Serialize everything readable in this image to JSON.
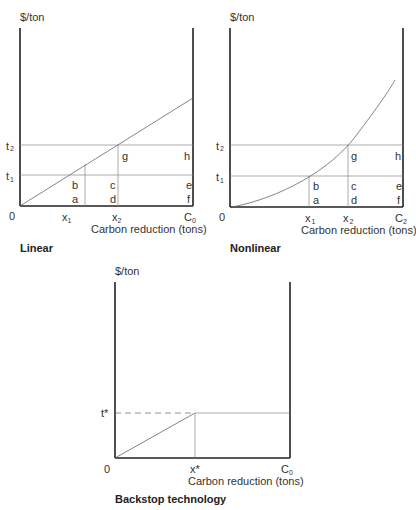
{
  "figure": {
    "panels": [
      {
        "id": "linear",
        "caption": "Linear",
        "y_label": "$/ton",
        "x_label": "Carbon reduction (tons)",
        "origin": "0",
        "y_ticks": [
          "t",
          "t"
        ],
        "y_tick_subs": [
          "2",
          "1"
        ],
        "x_ticks": [
          "x",
          "x",
          "C"
        ],
        "x_tick_subs": [
          "1",
          "2",
          "0"
        ],
        "regions": [
          "a",
          "b",
          "c",
          "d",
          "e",
          "f",
          "g",
          "h"
        ],
        "curve": "straight line from origin"
      },
      {
        "id": "nonlinear",
        "caption": "Nonlinear",
        "y_label": "$/ton",
        "x_label": "Carbon reduction (tons)",
        "origin": "0",
        "y_ticks": [
          "t",
          "t"
        ],
        "y_tick_subs": [
          "2",
          "1"
        ],
        "x_ticks": [
          "x",
          "x",
          "C"
        ],
        "x_tick_subs": [
          "1",
          "2",
          "2"
        ],
        "regions": [
          "a",
          "b",
          "c",
          "d",
          "e",
          "f",
          "g",
          "h"
        ],
        "curve": "convex curve from origin"
      },
      {
        "id": "backstop",
        "caption": "Backstop technology",
        "y_label": "$/ton",
        "x_label": "Carbon reduction (tons)",
        "origin": "0",
        "y_ticks": [
          "t*"
        ],
        "x_ticks": [
          "x*",
          "C"
        ],
        "x_tick_subs": [
          "",
          "0"
        ],
        "curve": "line from origin to (x*, t*), then horizontal at t*"
      }
    ]
  }
}
